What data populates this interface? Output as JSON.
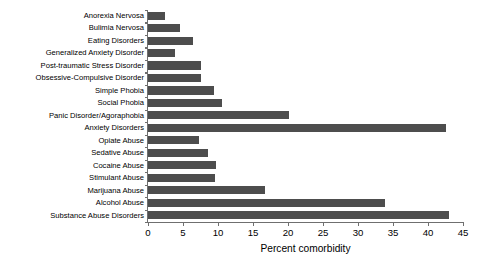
{
  "chart_data": {
    "type": "bar",
    "orientation": "horizontal",
    "title": "",
    "xlabel": "Percent comorbidity",
    "ylabel": "",
    "xlim": [
      0,
      45
    ],
    "xticks": [
      0,
      5,
      10,
      15,
      20,
      25,
      30,
      35,
      40,
      45
    ],
    "grid": false,
    "legend": null,
    "bar_color": "#4d4d4d",
    "background_color": "#ffffff",
    "axis_color": "#6f6f6f",
    "categories": [
      "Anorexia Nervosa",
      "Bulimia Nervosa",
      "Eating Disorders",
      "Generalized Anxiety Disorder",
      "Post-traumatic Stress Disorder",
      "Obsessive-Compulsive Disorder",
      "Simple Phobia",
      "Social Phobia",
      "Panic Disorder/Agoraphobia",
      "Anxiety Disorders",
      "Opiate Abuse",
      "Sedative Abuse",
      "Cocaine Abuse",
      "Stimulant Abuse",
      "Marijuana Abuse",
      "Alcohol Abuse",
      "Substance Abuse Disorders"
    ],
    "values": [
      2.4,
      4.5,
      6.4,
      3.8,
      7.6,
      7.5,
      9.4,
      10.6,
      20.1,
      42.6,
      7.3,
      8.6,
      9.7,
      9.6,
      16.7,
      33.9,
      43.0
    ]
  }
}
